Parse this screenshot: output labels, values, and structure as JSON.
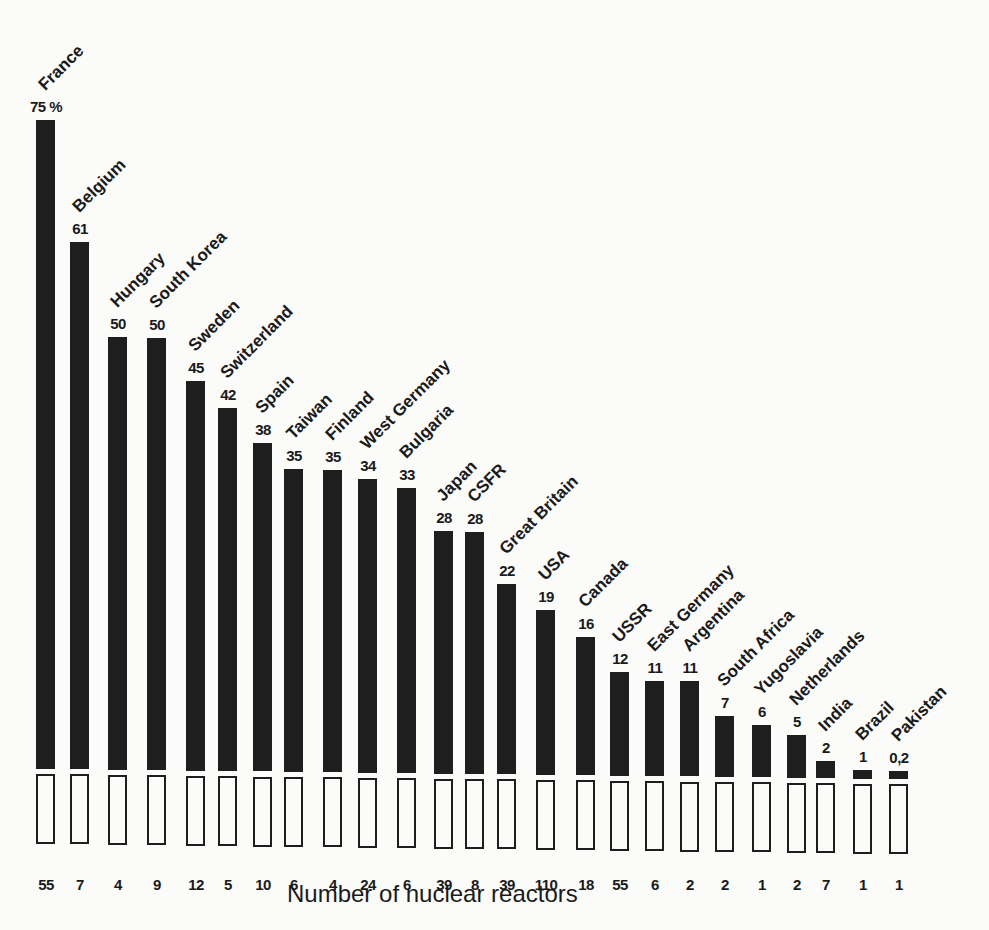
{
  "chart_data": {
    "type": "bar",
    "title": "",
    "xlabel": "Number of nuclear reactors",
    "ylabel": "Share of nuclear power in electricity generation (%)",
    "unit_label": "%",
    "ylim": [
      0,
      75
    ],
    "grid": false,
    "legend": null,
    "categories": [
      "France",
      "Belgium",
      "Hungary",
      "South Korea",
      "Sweden",
      "Switzerland",
      "Spain",
      "Taiwan",
      "Finland",
      "West Germany",
      "Bulgaria",
      "Japan",
      "CSFR",
      "Great Britain",
      "USA",
      "Canada",
      "USSR",
      "East Germany",
      "Argentina",
      "South Africa",
      "Yugoslavia",
      "Netherlands",
      "India",
      "Brazil",
      "Pakistan"
    ],
    "series": [
      {
        "name": "Nuclear share (%)",
        "values": [
          75,
          61,
          50,
          50,
          45,
          42,
          38,
          35,
          35,
          34,
          33,
          28,
          28,
          22,
          19,
          16,
          12,
          11,
          11,
          7,
          6,
          5,
          2,
          1,
          0.2
        ],
        "value_labels": [
          "75 %",
          "61",
          "50",
          "50",
          "45",
          "42",
          "38",
          "35",
          "35",
          "34",
          "33",
          "28",
          "28",
          "22",
          "19",
          "16",
          "12",
          "11",
          "11",
          "7",
          "6",
          "5",
          "2",
          "1",
          "0,2"
        ]
      },
      {
        "name": "Number of nuclear reactors",
        "values": [
          55,
          7,
          4,
          9,
          12,
          5,
          10,
          6,
          4,
          24,
          6,
          39,
          8,
          39,
          110,
          18,
          55,
          6,
          2,
          2,
          1,
          2,
          7,
          1,
          1
        ]
      }
    ]
  },
  "layout": {
    "bar_x": [
      36,
      70,
      108,
      147,
      186,
      218,
      253,
      284,
      323,
      358,
      397,
      434,
      465,
      497,
      536,
      576,
      610,
      645,
      680,
      715,
      752,
      787,
      816,
      853,
      889
    ],
    "base_left": 769,
    "base_right": 779,
    "px_per_unit": 8.65
  }
}
